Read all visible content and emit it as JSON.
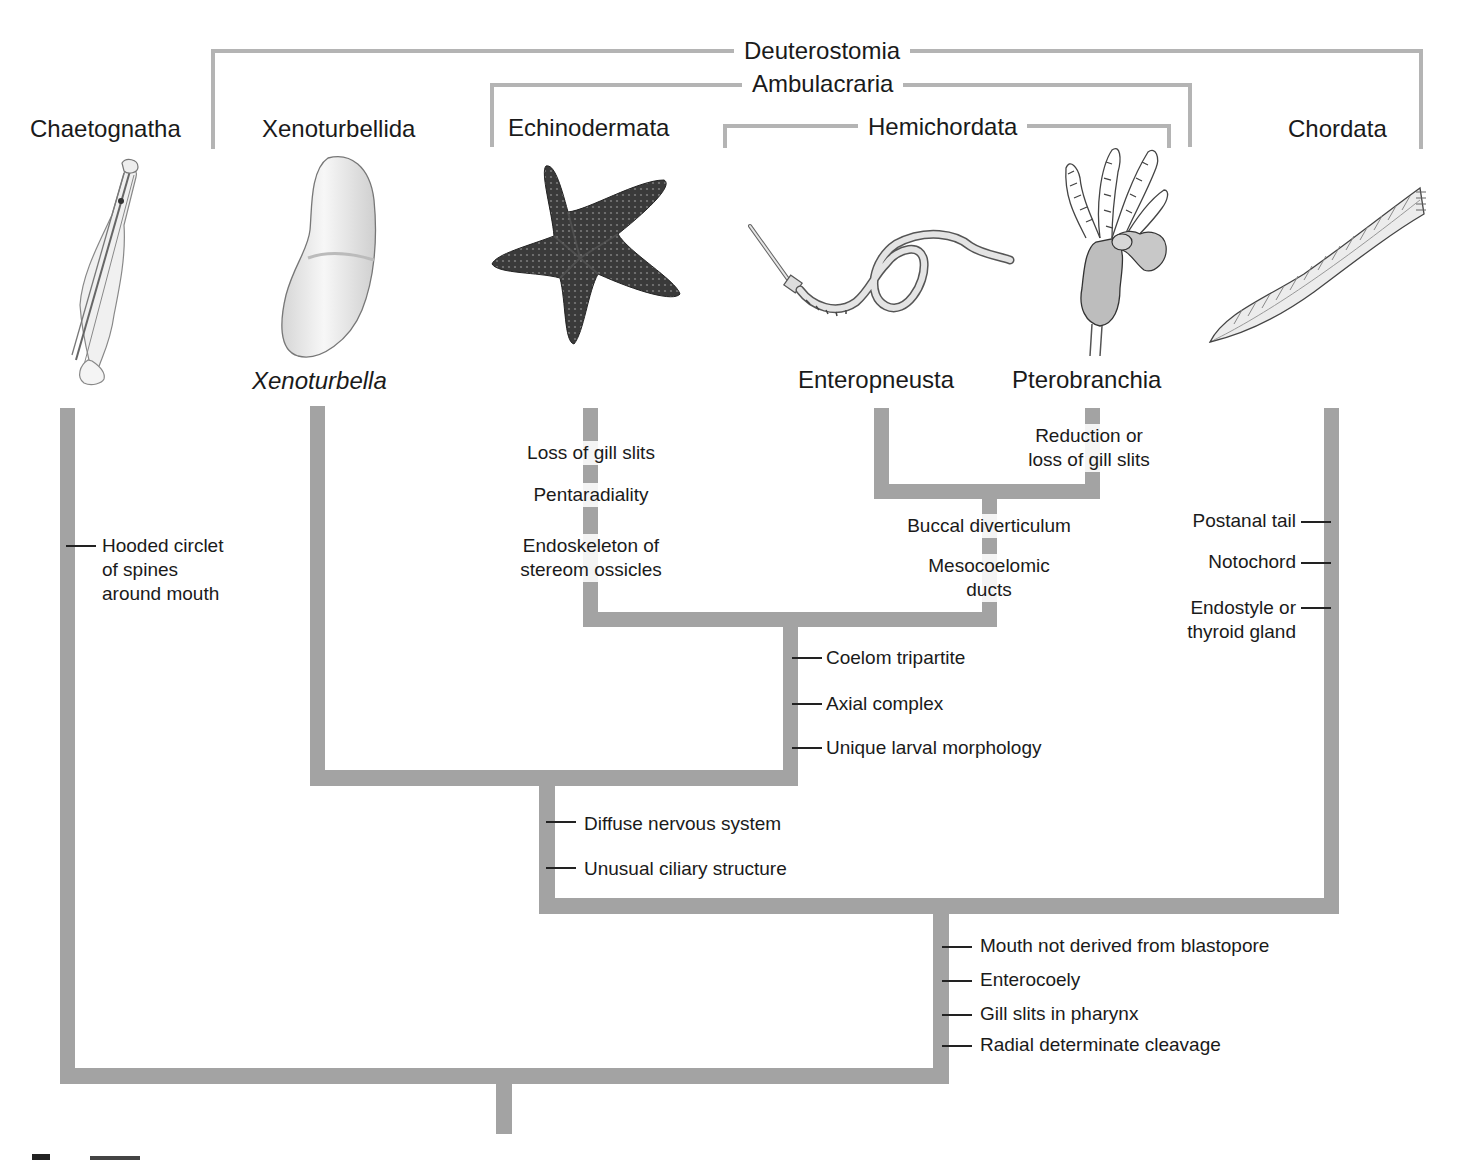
{
  "clades": {
    "deuterostomia": "Deuterostomia",
    "ambulacraria": "Ambulacraria",
    "hemichordata": "Hemichordata"
  },
  "taxa": {
    "chaetognatha": "Chaetognatha",
    "xenoturbellida": "Xenoturbellida",
    "echinodermata": "Echinodermata",
    "chordata": "Chordata",
    "xenoturbella": "Xenoturbella",
    "enteropneusta": "Enteropneusta",
    "pterobranchia": "Pterobranchia"
  },
  "illustrations": {
    "chaetognath": "arrow-worm-illustration",
    "xenoturbella": "xenoturbella-illustration",
    "sea_star": "sea-star-illustration",
    "acorn_worm": "acorn-worm-illustration",
    "pterobranch": "pterobranch-illustration",
    "lancelet": "lancelet-illustration"
  },
  "traits": {
    "chaetognatha": [
      "Hooded circlet",
      "of spines",
      "around mouth"
    ],
    "echinodermata": {
      "loss_gill": "Loss of gill slits",
      "pentaradiality": "Pentaradiality",
      "endoskeleton_1": "Endoskeleton of",
      "endoskeleton_2": "stereom ossicles"
    },
    "pterobranchia": [
      "Reduction or",
      "loss of gill slits"
    ],
    "hemichordata": {
      "buccal": "Buccal diverticulum",
      "meso_1": "Mesocoelomic",
      "meso_2": "ducts"
    },
    "chordata": {
      "postanal": "Postanal tail",
      "notochord": "Notochord",
      "endostyle_1": "Endostyle or",
      "endostyle_2": "thyroid gland"
    },
    "ambulacraria": [
      "Coelom tripartite",
      "Axial complex",
      "Unique larval morphology"
    ],
    "xeno_ambulacraria": [
      "Diffuse nervous system",
      "Unusual ciliary structure"
    ],
    "deuterostomia": [
      "Mouth not derived from blastopore",
      "Enterocoely",
      "Gill slits in pharynx",
      "Radial determinate cleavage"
    ]
  },
  "caption_fragment": "figure (cropped)",
  "colors": {
    "branch": "#a3a3a3",
    "bracket": "#b4b4b4",
    "text": "#1a1a1a"
  }
}
